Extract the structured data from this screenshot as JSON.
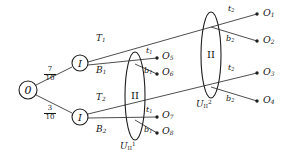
{
  "diagram": {
    "colors": {
      "stroke": "#3a3a3a",
      "node_stroke": "#1f1f1f",
      "text": "#141414",
      "background": "#ffffff"
    },
    "root": {
      "label": "0",
      "x": 28,
      "y": 90,
      "r": 9
    },
    "chance_probabilities": [
      {
        "name": "upper-branch-probability",
        "numerator": "7",
        "denominator": "10"
      },
      {
        "name": "lower-branch-probability",
        "numerator": "3",
        "denominator": "10"
      }
    ],
    "player_nodes": [
      {
        "name": "player-i-node-upper",
        "label": "I",
        "x": 80,
        "y": 63,
        "r": 8
      },
      {
        "name": "player-i-node-lower",
        "label": "I",
        "x": 80,
        "y": 117,
        "r": 8
      }
    ],
    "branch_labels": [
      {
        "name": "branch-label-t1",
        "text": "T",
        "sub": "1",
        "x": 96,
        "y": 34
      },
      {
        "name": "branch-label-b1",
        "text": "B",
        "sub": "1",
        "x": 96,
        "y": 66
      },
      {
        "name": "branch-label-t2",
        "text": "T",
        "sub": "2",
        "x": 96,
        "y": 93
      },
      {
        "name": "branch-label-b2",
        "text": "B",
        "sub": "2",
        "x": 96,
        "y": 125
      }
    ],
    "information_sets": [
      {
        "name": "infoset-u1-ii",
        "player_label": "II",
        "set_label": "U",
        "set_sub": "II",
        "set_sup": "1",
        "cx": 135,
        "cy": 96,
        "rx": 10,
        "ry": 44,
        "label_x": 121,
        "label_y": 143
      },
      {
        "name": "infoset-u2-ii",
        "player_label": "II",
        "set_label": "U",
        "set_sub": "II",
        "set_sup": "2",
        "cx": 211,
        "cy": 55,
        "rx": 10,
        "ry": 43,
        "label_x": 198,
        "label_y": 101
      }
    ],
    "action_labels": [
      {
        "name": "action-label-t1-o5",
        "text": "t",
        "sub": "1",
        "x": 146,
        "y": 52
      },
      {
        "name": "action-label-b1-o6",
        "text": "b",
        "sub": "1",
        "x": 146,
        "y": 70
      },
      {
        "name": "action-label-t1-o7",
        "text": "t",
        "sub": "1",
        "x": 146,
        "y": 111
      },
      {
        "name": "action-label-b1-o8",
        "text": "b",
        "sub": "1",
        "x": 146,
        "y": 129
      },
      {
        "name": "action-label-t2-o1",
        "text": "t",
        "sub": "2",
        "x": 228,
        "y": 9
      },
      {
        "name": "action-label-b2-o2",
        "text": "b",
        "sub": "2",
        "x": 228,
        "y": 40
      },
      {
        "name": "action-label-t2-o3",
        "text": "t",
        "sub": "2",
        "x": 228,
        "y": 69
      },
      {
        "name": "action-label-b2-o4",
        "text": "b",
        "sub": "2",
        "x": 228,
        "y": 100
      }
    ],
    "outcomes": [
      {
        "name": "outcome-o1",
        "text": "O",
        "sub": "1",
        "dot_x": 257,
        "dot_y": 14,
        "label_x": 264,
        "label_y": 8
      },
      {
        "name": "outcome-o2",
        "text": "O",
        "sub": "2",
        "dot_x": 257,
        "dot_y": 41,
        "label_x": 264,
        "label_y": 35
      },
      {
        "name": "outcome-o3",
        "text": "O",
        "sub": "3",
        "dot_x": 257,
        "dot_y": 73,
        "label_x": 264,
        "label_y": 67
      },
      {
        "name": "outcome-o4",
        "text": "O",
        "sub": "4",
        "dot_x": 257,
        "dot_y": 101,
        "label_x": 264,
        "label_y": 95
      },
      {
        "name": "outcome-o5",
        "text": "O",
        "sub": "5",
        "dot_x": 157,
        "dot_y": 58,
        "label_x": 163,
        "label_y": 52
      },
      {
        "name": "outcome-o6",
        "text": "O",
        "sub": "6",
        "dot_x": 157,
        "dot_y": 74,
        "label_x": 163,
        "label_y": 68
      },
      {
        "name": "outcome-o7",
        "text": "O",
        "sub": "7",
        "dot_x": 157,
        "dot_y": 117,
        "label_x": 163,
        "label_y": 111
      },
      {
        "name": "outcome-o8",
        "text": "O",
        "sub": "8",
        "dot_x": 157,
        "dot_y": 133,
        "label_x": 163,
        "label_y": 127
      }
    ]
  }
}
